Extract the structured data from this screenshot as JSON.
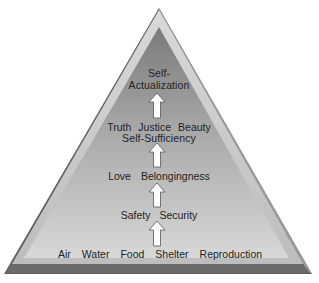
{
  "diagram": {
    "type": "pyramid",
    "levels": [
      {
        "id": "physiological",
        "words": [
          "Air",
          "Water",
          "Food",
          "Shelter",
          "Reproduction"
        ]
      },
      {
        "id": "safety",
        "words": [
          "Safety",
          "Security"
        ]
      },
      {
        "id": "love",
        "words": [
          "Love",
          "Belongingness"
        ]
      },
      {
        "id": "esteem",
        "line1": [
          "Truth",
          "Justice",
          "Beauty"
        ],
        "line2": "Self-Sufficiency"
      },
      {
        "id": "self_actualization",
        "line1": "Self-",
        "line2": "Actualization"
      }
    ],
    "arrows": 4,
    "colors": {
      "outer_face": "#c9c9c9",
      "outer_dark_edge": "#6a6a6a",
      "inner_top": "#7d7d7d",
      "inner_bottom": "#d6d6d6",
      "arrow_fill": "#ffffff",
      "text": "#222222"
    }
  }
}
